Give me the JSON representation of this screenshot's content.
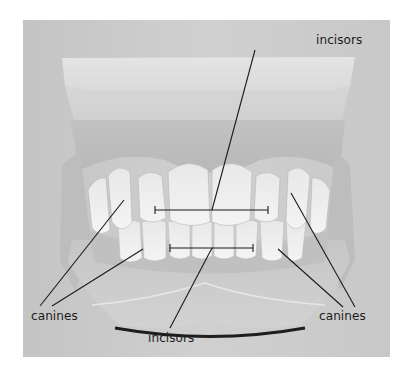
{
  "figure": {
    "background_color": "#c9c9c9",
    "line_color": "#1a1a1a"
  },
  "labels": {
    "incisors_top": "incisors",
    "canines_left": "canines",
    "incisors_bottom": "incisors",
    "canines_right": "canines"
  }
}
